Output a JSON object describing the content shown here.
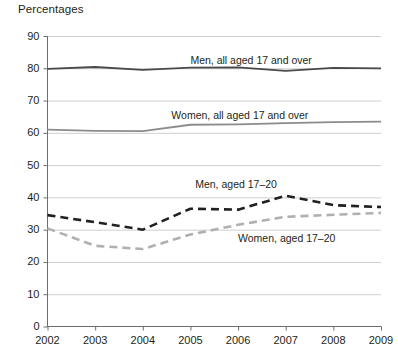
{
  "chart_data": {
    "type": "line",
    "title": "Percentages",
    "xlabel": "",
    "ylabel": "Percentages",
    "ylim": [
      0,
      90
    ],
    "ytick_step": 10,
    "yticks": [
      "0",
      "10",
      "20",
      "30",
      "40",
      "50",
      "60",
      "70",
      "80",
      "90"
    ],
    "grid": true,
    "grid_axis": "y",
    "legend_position": "inline-annotations",
    "categories": [
      "2002",
      "2003",
      "2004",
      "2005",
      "2006",
      "2007",
      "2008",
      "2009"
    ],
    "x": [
      2002,
      2003,
      2004,
      2005,
      2006,
      2007,
      2008,
      2009
    ],
    "series": [
      {
        "name": "Men, all aged 17 and over",
        "style": "solid",
        "color": "#4a4a4a",
        "values": [
          79.8,
          80.4,
          79.5,
          80.2,
          80.3,
          79.2,
          80.1,
          80.0
        ]
      },
      {
        "name": "Women, all aged 17 and over",
        "style": "solid",
        "color": "#8c8c8c",
        "values": [
          61.0,
          60.6,
          60.5,
          62.5,
          62.6,
          63.0,
          63.3,
          63.5
        ]
      },
      {
        "name": "Men, aged 17–20",
        "style": "dashed",
        "color": "#231f20",
        "values": [
          34.5,
          32.3,
          30.0,
          36.5,
          36.2,
          40.5,
          37.6,
          37.0
        ]
      },
      {
        "name": "Women, aged 17–20",
        "style": "dashed",
        "color": "#b0b0b0",
        "values": [
          30.4,
          25.0,
          24.0,
          28.5,
          31.5,
          34.0,
          34.6,
          35.2
        ]
      }
    ],
    "annotations": [
      {
        "text": "Men, all aged 17 and over",
        "x": 2005.0,
        "y": 82.6
      },
      {
        "text": "Women, all aged 17 and over",
        "x": 2004.6,
        "y": 65.6
      },
      {
        "text": "Men, aged 17–20",
        "x": 2005.1,
        "y": 44.0
      },
      {
        "text": "Women, aged 17–20",
        "x": 2006.0,
        "y": 27.5
      }
    ]
  },
  "colors": {
    "grid": "#cfcfcf",
    "axis": "#6d6d6d",
    "text": "#231f20",
    "men_all": "#4a4a4a",
    "women_all": "#8c8c8c",
    "men_young": "#231f20",
    "women_young": "#b0b0b0"
  }
}
